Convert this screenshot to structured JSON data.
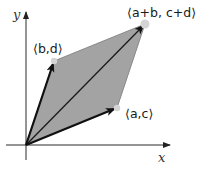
{
  "diagram": {
    "colors": {
      "fill": "#a3a3a3",
      "stroke": "#1a1a1a",
      "axis": "#2a2a2a",
      "point": "#d4d4d4",
      "background": "#ffffff"
    },
    "axes": {
      "x_label": "x",
      "y_label": "y"
    },
    "points": {
      "origin": {
        "x": 26,
        "y": 145
      },
      "v1": {
        "x": 117,
        "y": 108,
        "label": "⟨a,c⟩"
      },
      "v2": {
        "x": 54,
        "y": 61,
        "label": "⟨b,d⟩"
      },
      "sum": {
        "x": 145,
        "y": 24,
        "label": "⟨a+b, c+d⟩"
      }
    },
    "labels": {
      "v1": "⟨a,c⟩",
      "v2": "⟨b,d⟩",
      "sum": "⟨a+b, c+d⟩"
    }
  }
}
